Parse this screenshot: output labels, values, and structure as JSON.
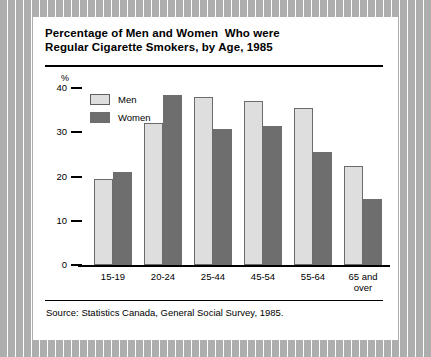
{
  "figure": {
    "title_line_1": "Percentage of Men and Women  Who were",
    "title_line_2": "Regular Cigarette Smokers, by Age, 1985",
    "source": "Source: Statistics Canada, General Social Survey, 1985.",
    "unit_label": "%"
  },
  "chart_data": {
    "type": "bar",
    "title": "Percentage of Men and Women  Who were Regular Cigarette Smokers, by Age, 1985",
    "xlabel": "",
    "ylabel": "%",
    "ylim": [
      0,
      40
    ],
    "yticks": [
      0,
      10,
      20,
      30,
      40
    ],
    "ytick_labels": [
      "0",
      "10",
      "20",
      "30",
      "40"
    ],
    "grid": false,
    "legend_position": "top-left",
    "categories": [
      "15-19",
      "20-24",
      "25-44",
      "45-54",
      "55-64",
      "65 and\nover"
    ],
    "category_labels": [
      "15-19",
      "20-24",
      "25-44",
      "45-54",
      "55-64",
      "65 and over"
    ],
    "series": [
      {
        "name": "Men",
        "color": "#dedede",
        "values": [
          19.5,
          32,
          38,
          37,
          35.5,
          22.3
        ]
      },
      {
        "name": "Women",
        "color": "#6e6e6e",
        "values": [
          21,
          38.5,
          30.7,
          31.5,
          25.5,
          15
        ]
      }
    ]
  }
}
